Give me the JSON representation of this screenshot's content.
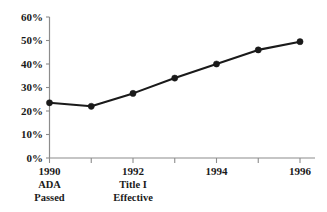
{
  "chart_data": {
    "type": "line",
    "title": "",
    "subtitle": "",
    "xlabel": "",
    "ylabel": "",
    "x": [
      1990,
      1991,
      1992,
      1993,
      1994,
      1995,
      1996
    ],
    "categories": [
      "1990",
      "1991",
      "1992",
      "1993",
      "1994",
      "1995",
      "1996"
    ],
    "values": [
      23.5,
      22.0,
      27.5,
      34.0,
      40.0,
      46.0,
      49.5
    ],
    "series": [
      {
        "name": "",
        "values": [
          23.5,
          22.0,
          27.5,
          34.0,
          40.0,
          46.0,
          49.5
        ]
      }
    ],
    "ylim": [
      0,
      60
    ],
    "xlim": [
      1990,
      1996
    ],
    "yticks": [
      0,
      10,
      20,
      30,
      40,
      50,
      60
    ],
    "ytick_labels": [
      "0%",
      "10%",
      "20%",
      "30%",
      "40%",
      "50%",
      "60%"
    ],
    "xticks": [
      1990,
      1991,
      1992,
      1993,
      1994,
      1995,
      1996
    ],
    "xtick_labels": [
      "1990",
      "",
      "1992",
      "",
      "1994",
      "",
      "1996"
    ],
    "annotations": [
      {
        "x": 1990,
        "lines": [
          "ADA",
          "Passed"
        ]
      },
      {
        "x": 1992,
        "lines": [
          "Title I",
          "Effective"
        ]
      }
    ],
    "grid": false,
    "legend": false,
    "legend_position": "none",
    "colors": {
      "line": "#1a1a1a",
      "marker": "#1a1a1a",
      "axis": "#8c8c8c",
      "text": "#1a1a1a",
      "background": "#ffffff"
    }
  }
}
